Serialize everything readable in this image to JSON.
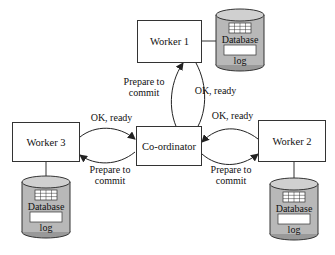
{
  "diagram": {
    "title": "",
    "nodes": {
      "worker1": {
        "label": "Worker 1"
      },
      "worker2": {
        "label": "Worker 2"
      },
      "worker3": {
        "label": "Worker 3"
      },
      "coordinator": {
        "label": "Co-ordinator"
      }
    },
    "databases": {
      "db1": {
        "label": "Database",
        "log": "log"
      },
      "db2": {
        "label": "Database",
        "log": "log"
      },
      "db3": {
        "label": "Database",
        "log": "log"
      }
    },
    "edges": {
      "w1_prepare": {
        "label_line1": "Prepare to",
        "label_line2": "commit"
      },
      "w1_ok": {
        "label": "OK, ready"
      },
      "w3_ok": {
        "label": "OK, ready"
      },
      "w3_prepare": {
        "label_line1": "Prepare to",
        "label_line2": "commit"
      },
      "w2_ok": {
        "label": "OK, ready"
      },
      "w2_prepare": {
        "label_line1": "Prepare to",
        "label_line2": "commit"
      }
    },
    "colors": {
      "cylinder_fill": "#b8b8b8",
      "stroke": "#333333"
    }
  }
}
